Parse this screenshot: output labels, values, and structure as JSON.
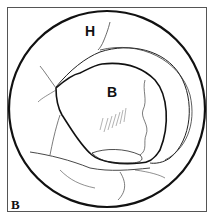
{
  "figure": {
    "panel_label": "B",
    "labels": {
      "upper_region": "H",
      "central_region": "B"
    },
    "colors": {
      "line": "#111111",
      "fine_line": "#444444",
      "background": "#ffffff",
      "frame": "#555555"
    }
  }
}
